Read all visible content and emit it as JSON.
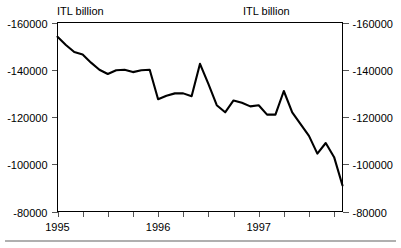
{
  "chart_data": {
    "type": "line",
    "title": "",
    "subtitle": "",
    "unit_label_left": "ITL billion",
    "unit_label_right": "ITL billion",
    "xlabel": "",
    "ylabel": "",
    "ylim": [
      -160000,
      -80000
    ],
    "y_axis_inverted": true,
    "y_ticks": [
      -160000,
      -140000,
      -120000,
      -100000,
      -80000
    ],
    "y_tick_labels_left": [
      "-160000",
      "-140000",
      "-120000",
      "-100000",
      "-80000"
    ],
    "y_tick_labels_right": [
      "-160000",
      "-140000",
      "-120000",
      "-100000",
      "-80000"
    ],
    "x_tick_labels": [
      "1995",
      "1996",
      "1997"
    ],
    "x_tick_label_positions": [
      0,
      12,
      24
    ],
    "x_minor_ticks_per_year": 4,
    "xlim": [
      0,
      34
    ],
    "grid": false,
    "legend": false,
    "legend_position": "none",
    "series": [
      {
        "name": "Balance",
        "color": "#000000",
        "x": [
          0,
          1,
          2,
          3,
          4,
          5,
          6,
          7,
          8,
          9,
          10,
          11,
          12,
          13,
          14,
          15,
          16,
          17,
          18,
          19,
          20,
          21,
          22,
          23,
          24,
          25,
          26,
          27,
          28,
          29,
          30,
          31,
          32,
          33,
          34
        ],
        "values": [
          -154000,
          -150500,
          -147500,
          -146500,
          -143000,
          -140000,
          -138200,
          -139800,
          -140000,
          -139000,
          -139800,
          -140000,
          -127500,
          -129000,
          -130000,
          -130000,
          -128800,
          -142500,
          -134000,
          -125000,
          -122000,
          -127000,
          -126000,
          -124500,
          -125000,
          -121000,
          -121000,
          -131000,
          -122000,
          -117000,
          -112000,
          -104500,
          -109000,
          -103000,
          -91000
        ]
      }
    ]
  },
  "axes": {
    "left_axis_name": "left-value-axis",
    "right_axis_name": "right-value-axis",
    "bottom_axis_name": "time-axis"
  }
}
